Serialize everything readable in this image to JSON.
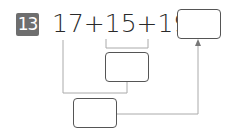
{
  "problem": {
    "number": "13",
    "expression": "17+15+19=",
    "answer_box": "",
    "intermediate_box": "",
    "final_sum_box": ""
  },
  "colors": {
    "badge": "#6e6e6e",
    "lines": "#999999",
    "box_border": "#555555"
  }
}
